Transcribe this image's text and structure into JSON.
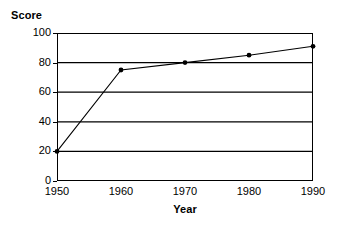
{
  "chart_data": {
    "type": "line",
    "title": "",
    "subtitle": "",
    "xlabel": "Year",
    "ylabel": "Score",
    "x": [
      1950,
      1960,
      1970,
      1980,
      1990
    ],
    "categories": [
      "1950",
      "1960",
      "1970",
      "1980",
      "1990"
    ],
    "values": [
      20,
      75,
      80,
      85,
      91
    ],
    "series": [
      {
        "name": "Score",
        "values": [
          20,
          75,
          80,
          85,
          91
        ]
      }
    ],
    "xlim": [
      1950,
      1990
    ],
    "ylim": [
      0,
      100
    ],
    "x_ticks": [
      1950,
      1960,
      1970,
      1980,
      1990
    ],
    "x_tick_labels": [
      "1950",
      "1960",
      "1970",
      "1980",
      "1990"
    ],
    "y_ticks": [
      0,
      20,
      40,
      60,
      80,
      100
    ],
    "y_tick_labels": [
      "0",
      "20",
      "40",
      "60",
      "80",
      "100"
    ],
    "grid": "horizontal",
    "legend": "none",
    "marker": "filled-circle",
    "line_color": "#000000",
    "marker_color": "#000000",
    "grid_color": "#000000",
    "axis_color": "#000000",
    "background_color": "#ffffff"
  },
  "axes": {
    "y_title": "Score",
    "x_title": "Year"
  }
}
